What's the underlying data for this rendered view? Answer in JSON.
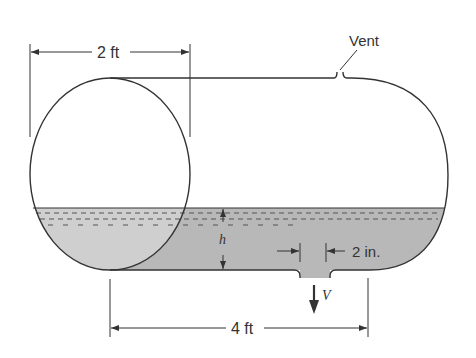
{
  "figure": {
    "type": "diagram",
    "colors": {
      "outline": "#333333",
      "liquid": "#c8c8c8",
      "liquid_dark": "#b4b4b4",
      "background": "#ffffff"
    }
  },
  "labels": {
    "diameter": "2 ft",
    "length": "4 ft",
    "vent": "Vent",
    "depth": "h",
    "orifice_diameter": "2 in.",
    "velocity": "V"
  }
}
